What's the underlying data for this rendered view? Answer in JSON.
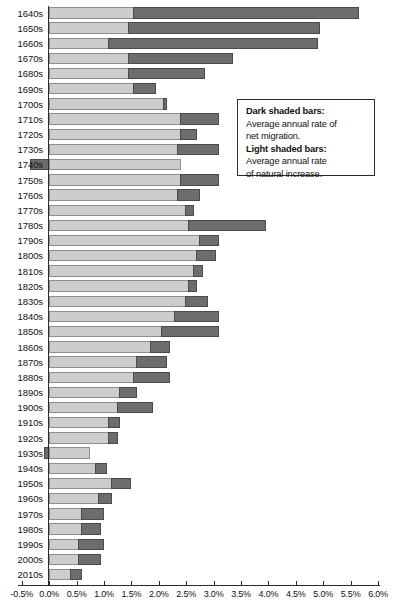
{
  "chart_data": {
    "type": "bar",
    "orientation": "horizontal",
    "stacked": true,
    "title": "",
    "subtitle": "",
    "xlabel": "",
    "ylabel": "",
    "xlim": [
      -0.5,
      6.0
    ],
    "grid": false,
    "legend_position": "inside-right",
    "axis_tick_labels": [
      "-0.5%",
      "0.0%",
      "0.5%",
      "1.0%",
      "1.5%",
      "2.0%",
      "2.5%",
      "3.0%",
      "3.5%",
      "4.0%",
      "4.5%",
      "5.0%",
      "5.5%",
      "6.0%"
    ],
    "axis_tick_values": [
      -0.5,
      0.0,
      0.5,
      1.0,
      1.5,
      2.0,
      2.5,
      3.0,
      3.5,
      4.0,
      4.5,
      5.0,
      5.5,
      6.0
    ],
    "categories": [
      "1640s",
      "1650s",
      "1660s",
      "1670s",
      "1680s",
      "1690s",
      "1700s",
      "1710s",
      "1720s",
      "1730s",
      "1740s",
      "1750s",
      "1760s",
      "1770s",
      "1780s",
      "1790s",
      "1800s",
      "1810s",
      "1820s",
      "1830s",
      "1840s",
      "1850s",
      "1860s",
      "1870s",
      "1880s",
      "1890s",
      "1900s",
      "1910s",
      "1920s",
      "1930s",
      "1940s",
      "1950s",
      "1960s",
      "1970s",
      "1980s",
      "1990s",
      "2000s",
      "2010s"
    ],
    "series": [
      {
        "name": "Average annual rate of natural increase",
        "shade": "light",
        "color": "#cdcdcd",
        "values": [
          1.55,
          1.45,
          1.1,
          1.45,
          1.45,
          1.55,
          2.1,
          2.4,
          2.4,
          2.35,
          2.4,
          2.4,
          2.35,
          2.5,
          2.55,
          2.75,
          2.7,
          2.65,
          2.55,
          2.5,
          2.3,
          2.05,
          1.85,
          1.6,
          1.55,
          1.3,
          1.25,
          1.1,
          1.1,
          0.75,
          0.85,
          1.15,
          0.9,
          0.6,
          0.6,
          0.55,
          0.55,
          0.4
        ]
      },
      {
        "name": "Average annual rate of net migration",
        "shade": "dark",
        "color": "#6d6d6d",
        "values": [
          4.1,
          3.5,
          3.8,
          1.9,
          1.4,
          0.4,
          0.05,
          0.7,
          0.3,
          0.75,
          -0.35,
          0.7,
          0.4,
          0.15,
          1.4,
          0.35,
          0.35,
          0.15,
          0.15,
          0.4,
          0.8,
          1.05,
          0.35,
          0.55,
          0.65,
          0.3,
          0.65,
          0.2,
          0.15,
          -0.1,
          0.2,
          0.35,
          0.25,
          0.4,
          0.35,
          0.45,
          0.4,
          0.2
        ]
      }
    ]
  },
  "legend": {
    "dark_heading": "Dark shaded bars:",
    "dark_line1": "Average annual rate of",
    "dark_line2": "net migration.",
    "light_heading": "Light shaded bars:",
    "light_line1": "Average annual rate",
    "light_line2": "of natural increase."
  }
}
